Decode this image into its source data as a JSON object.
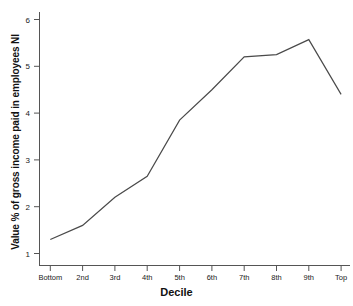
{
  "chart_data": {
    "type": "line",
    "title": "",
    "xlabel": "Decile",
    "ylabel": "Value % of gross income paid in employees NI",
    "categories": [
      "Bottom",
      "2nd",
      "3rd",
      "4th",
      "5th",
      "6th",
      "7th",
      "8th",
      "9th",
      "Top"
    ],
    "values": [
      1.3,
      1.6,
      2.2,
      2.65,
      3.85,
      4.5,
      5.2,
      5.25,
      5.57,
      4.4
    ],
    "series": [
      {
        "name": "Value % of gross income paid in employees NI",
        "values": [
          1.3,
          1.6,
          2.2,
          2.65,
          3.85,
          4.5,
          5.2,
          5.25,
          5.57,
          4.4
        ]
      }
    ],
    "ylim": [
      0.7,
      6.3
    ],
    "yticks": [
      1,
      2,
      3,
      4,
      5,
      6
    ],
    "ytick_labels": [
      "1",
      "2",
      "3",
      "4",
      "5",
      "6"
    ],
    "grid": false,
    "legend": false,
    "legend_position": "none",
    "line_color": "#4a4a4a",
    "axis_color": "#555555",
    "background_color": "#ffffff"
  },
  "axes": {
    "y_title": "Value % of gross income paid in employees NI",
    "x_title": "Decile"
  }
}
